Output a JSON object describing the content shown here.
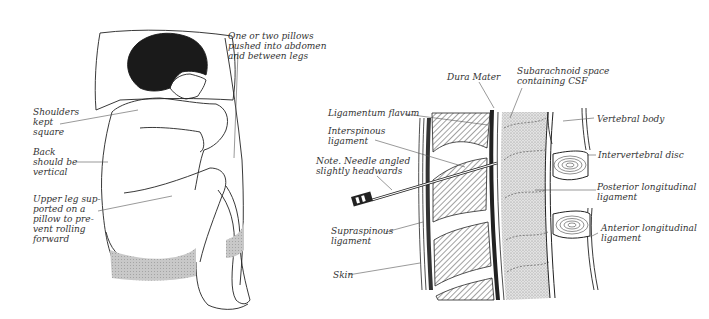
{
  "left_panel": {
    "title": "Patient positioning (lateral decubitus)",
    "labels": {
      "pillows": "One or two pillows\npushed into abdomen\nand between legs",
      "shoulders": "Shoulders\nkept\nsquare",
      "back": "Back\nshould be\nvertical",
      "upper_leg": "Upper leg sup-\nported on a\npillow to pre-\nvent rolling\nforward"
    }
  },
  "right_panel": {
    "title": "Spinal anatomy with needle insertion",
    "labels": {
      "dura_mater": "Dura Mater",
      "subarachnoid": "Subarachnoid space\ncontaining CSF",
      "ligamentum_flavum": "Ligamentum flavum",
      "interspinous": "Interspinous\nligament",
      "note": "Note.  Needle angled\nslightly headwards",
      "supraspinous": "Supraspinous\nligament",
      "skin": "Skin",
      "vertebral_body": "Vertebral body",
      "intervertebral_disc": "Intervertebral disc",
      "posterior_ligament": "Posterior longitudinal\nligament",
      "anterior_ligament": "Anterior longitudinal\nligament"
    }
  },
  "colors": {
    "ink": "#222222",
    "label_text": "#333333",
    "stipple": "#cfcfcf",
    "hatch": "#444444",
    "pillow_shade": "#bdbdbd",
    "hair": "#1a1a1a"
  }
}
